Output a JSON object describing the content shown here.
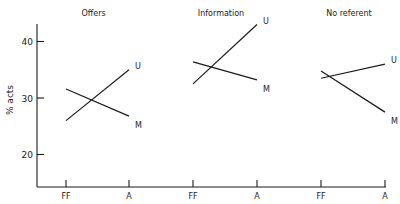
{
  "chart_data": {
    "type": "line",
    "ylabel": "% acts",
    "xlabel": "",
    "ylim": [
      15,
      44
    ],
    "yticks": [
      20,
      30,
      40
    ],
    "grid": false,
    "panels": [
      {
        "title": "Offers",
        "categories": [
          "FF",
          "A"
        ],
        "series": [
          {
            "name": "U",
            "values": [
              26,
              35
            ]
          },
          {
            "name": "M",
            "values": [
              31.6,
              26.8
            ]
          }
        ]
      },
      {
        "title": "Information",
        "categories": [
          "FF",
          "A"
        ],
        "series": [
          {
            "name": "U",
            "values": [
              32.5,
              43
            ]
          },
          {
            "name": "M",
            "values": [
              36.4,
              33.2
            ]
          }
        ]
      },
      {
        "title": "No referent",
        "categories": [
          "FF",
          "A"
        ],
        "series": [
          {
            "name": "U",
            "values": [
              33.5,
              36
            ]
          },
          {
            "name": "M",
            "values": [
              34.8,
              27.5
            ]
          }
        ]
      }
    ]
  },
  "colors": {
    "ink": "#1a1a1a",
    "background": "#ffffff"
  }
}
